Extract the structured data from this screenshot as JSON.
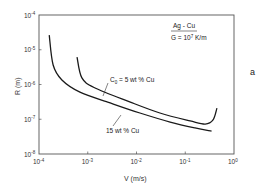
{
  "chart_data": {
    "type": "line",
    "title": "",
    "panel_label": "a",
    "xlabel": "V (m/s)",
    "ylabel": "R (m)",
    "xscale": "log",
    "yscale": "log",
    "xlim": [
      0.0001,
      1
    ],
    "ylim": [
      1e-08,
      0.0001
    ],
    "x_ticks": [
      {
        "base": "10",
        "exp": "-4",
        "log": -4
      },
      {
        "base": "10",
        "exp": "-3",
        "log": -3
      },
      {
        "base": "10",
        "exp": "-2",
        "log": -2
      },
      {
        "base": "10",
        "exp": "-1",
        "log": -1
      },
      {
        "base": "10",
        "exp": "0",
        "log": 0
      }
    ],
    "y_ticks": [
      {
        "base": "10",
        "exp": "-4",
        "log": -4
      },
      {
        "base": "10",
        "exp": "-5",
        "log": -5
      },
      {
        "base": "10",
        "exp": "-6",
        "log": -6
      },
      {
        "base": "10",
        "exp": "-7",
        "log": -7
      },
      {
        "base": "10",
        "exp": "-8",
        "log": -8
      }
    ],
    "grid": false,
    "legend": null,
    "annotations": {
      "system": "Ag - Cu",
      "gradient_prefix": "G = 10",
      "gradient_exp": "7",
      "gradient_suffix": " K/m",
      "curve_label_5": "C",
      "curve_label_5_sub": "0",
      "curve_label_5_rest": " = 5 wt % Cu",
      "curve_label_15": "15 wt % Cu"
    },
    "series": [
      {
        "name": "C0 = 5 wt % Cu",
        "x": [
          0.0006,
          0.00076,
          0.0014,
          0.0073,
          0.03,
          0.125,
          0.255,
          0.37,
          0.45
        ],
        "y": [
          6.1e-06,
          1.55e-06,
          7.9e-07,
          3.2e-07,
          1.5e-07,
          8.9e-08,
          7.3e-08,
          9.5e-08,
          2.1e-07
        ],
        "log_x": [
          -3.22,
          -3.12,
          -2.85,
          -2.14,
          -1.52,
          -0.9,
          -0.59,
          -0.43,
          -0.35
        ],
        "log_y": [
          -5.21,
          -5.81,
          -6.1,
          -6.5,
          -6.82,
          -7.05,
          -7.14,
          -7.02,
          -6.68
        ]
      },
      {
        "name": "15 wt % Cu",
        "x": [
          0.00016,
          0.00019,
          0.0003,
          0.00069,
          0.0029,
          0.0118,
          0.049,
          0.158,
          0.35
        ],
        "y": [
          2.6e-05,
          3.6e-06,
          1.35e-06,
          6.1e-07,
          2.9e-07,
          1.5e-07,
          8.3e-08,
          5.6e-08,
          4.6e-08
        ],
        "log_x": [
          -3.79,
          -3.71,
          -3.53,
          -3.16,
          -2.54,
          -1.93,
          -1.31,
          -0.8,
          -0.46
        ],
        "log_y": [
          -4.58,
          -5.44,
          -5.87,
          -6.22,
          -6.53,
          -6.82,
          -7.08,
          -7.25,
          -7.34
        ]
      }
    ]
  }
}
